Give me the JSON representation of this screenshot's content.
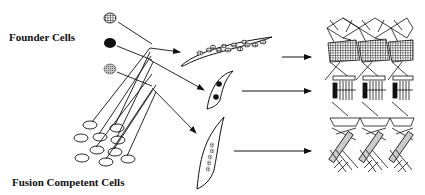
{
  "labels": {
    "founder_cells": "Founder Cells",
    "fusion_competent_cells": "Fusion Competent Cells"
  },
  "founder_cells": [
    {
      "pattern": "crosshatch",
      "x": 110,
      "y": 18
    },
    {
      "pattern": "solid-black",
      "x": 110,
      "y": 43
    },
    {
      "pattern": "stippled-gray",
      "x": 110,
      "y": 69
    }
  ],
  "myotubes": [
    {
      "name": "myotube-crosshatch-nuclei",
      "nuclei_count": 12
    },
    {
      "name": "myotube-solid-nuclei",
      "nuclei_count": 2
    },
    {
      "name": "myotube-stippled-nuclei",
      "nuclei_count": 5
    }
  ],
  "muscle_patterns": [
    {
      "name": "dorsal-muscle-pattern"
    },
    {
      "name": "lateral-muscle-pattern"
    },
    {
      "name": "ventral-muscle-pattern"
    }
  ],
  "colors": {
    "ink": "#111111",
    "stipple": "#9a9a9a",
    "background": "#ffffff"
  }
}
